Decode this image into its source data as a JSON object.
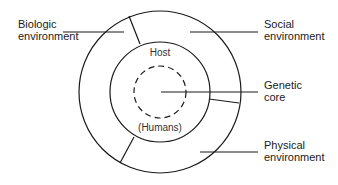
{
  "diagram": {
    "type": "concentric-circles",
    "title": "",
    "labels": {
      "biologic": [
        "Biologic",
        "environment"
      ],
      "social": [
        "Social",
        "environment"
      ],
      "genetic": [
        "Genetic",
        "core"
      ],
      "physical": [
        "Physical",
        "environment"
      ],
      "host": "Host",
      "humans": "(Humans)"
    },
    "colors": {
      "stroke": "#1a1a1a",
      "background": "#ffffff"
    }
  }
}
